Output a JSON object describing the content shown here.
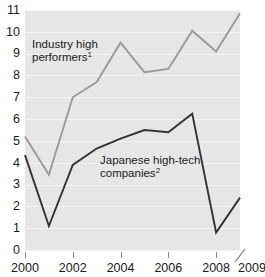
{
  "chart_data": {
    "type": "line",
    "title": "",
    "subtitle": "",
    "xlabel": "",
    "ylabel": "",
    "xlim": [
      2000,
      2009
    ],
    "ylim": [
      0,
      11
    ],
    "grid": true,
    "legend_position": "inline-annotation",
    "x": [
      2000,
      2001,
      2002,
      2003,
      2004,
      2005,
      2006,
      2007,
      2008,
      2009
    ],
    "x_tick_labels": [
      "2000",
      "2002",
      "2004",
      "2006",
      "2008",
      "2009"
    ],
    "x_tick_values": [
      2000,
      2002,
      2004,
      2006,
      2008,
      2009
    ],
    "y_tick_labels": [
      "0",
      "1",
      "2",
      "3",
      "4",
      "5",
      "6",
      "7",
      "8",
      "9",
      "10",
      "11"
    ],
    "y_tick_values": [
      0,
      1,
      2,
      3,
      4,
      5,
      6,
      7,
      8,
      9,
      10,
      11
    ],
    "axis_break_after": 2008,
    "series": [
      {
        "name": "Industry high performers",
        "footnote_marker": "1",
        "color": "#999999",
        "line_width": 1.9,
        "values": [
          5.2,
          3.45,
          7.0,
          7.7,
          9.5,
          8.15,
          8.3,
          10.05,
          9.1,
          10.85
        ]
      },
      {
        "name": "Japanese high-tech companies",
        "footnote_marker": "2",
        "color": "#333333",
        "line_width": 1.9,
        "values": [
          4.35,
          1.1,
          3.9,
          4.65,
          5.1,
          5.5,
          5.4,
          6.25,
          0.8,
          2.4
        ]
      }
    ],
    "annotations": [
      {
        "id": "industry-high-performers",
        "lines": [
          "Industry high",
          "performers"
        ],
        "footnote_marker": "1",
        "x_px": 32,
        "y_px": 48
      },
      {
        "id": "japanese-high-tech",
        "lines": [
          "Japanese high-tech",
          "companies"
        ],
        "footnote_marker": "2",
        "x_px": 100,
        "y_px": 164
      }
    ]
  },
  "colors": {
    "plot_background": "#e6e6e6",
    "gridline": "#f4f4f4",
    "series_light": "#999999",
    "series_dark": "#333333",
    "text": "#1a1a1a",
    "tick": "#8a8a8a"
  }
}
